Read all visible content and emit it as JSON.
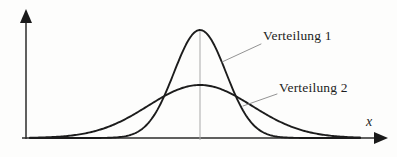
{
  "figure": {
    "background_color": "#fdfdfc",
    "width": 397,
    "height": 157,
    "axis_color": "#2b2b2b",
    "curve_color": "#1c1c1c",
    "leader_color": "#8d8d8d",
    "mean_line_color": "#a9a9a9"
  },
  "axes": {
    "x_axis_label": "x",
    "y_axis_label": "",
    "x_axis_name": "x-axis-arrow",
    "y_axis_name": "y-axis-arrow"
  },
  "labels": {
    "distribution_1": "Verteilung 1",
    "distribution_2": "Verteilung 2"
  },
  "chart_data": {
    "type": "line",
    "title": "",
    "subtitle": "",
    "xlabel": "x",
    "ylabel": "",
    "grid": false,
    "legend_position": "inline-annotations",
    "xlim": [
      22,
      388
    ],
    "ylim": [
      0,
      138
    ],
    "annotations": [
      {
        "text": "Verteilung 1",
        "x": 263,
        "y": 35,
        "leader_from": [
          222,
          62
        ],
        "leader_to": [
          261,
          44
        ]
      },
      {
        "text": "Verteilung 2",
        "x": 279,
        "y": 87,
        "leader_from": [
          243,
          106
        ],
        "leader_to": [
          277,
          94
        ]
      }
    ],
    "mean_marker": {
      "x": 200,
      "label": "",
      "from_y": 30,
      "to_y": 138
    },
    "series": [
      {
        "name": "Verteilung 1",
        "distribution": "normal",
        "mean": 200,
        "sigma": 26,
        "peak_x": 200,
        "peak_y": 30,
        "amplitude": 108,
        "baseline_y": 138,
        "x_start": 30,
        "x_end": 360,
        "color": "#1c1c1c"
      },
      {
        "name": "Verteilung 2",
        "distribution": "normal",
        "mean": 200,
        "sigma": 52,
        "peak_x": 200,
        "peak_y": 85,
        "amplitude": 53,
        "baseline_y": 138,
        "x_start": 30,
        "x_end": 360,
        "color": "#1c1c1c"
      }
    ],
    "intersections": [
      {
        "x": 168,
        "y": 98
      },
      {
        "x": 233,
        "y": 98
      }
    ]
  }
}
